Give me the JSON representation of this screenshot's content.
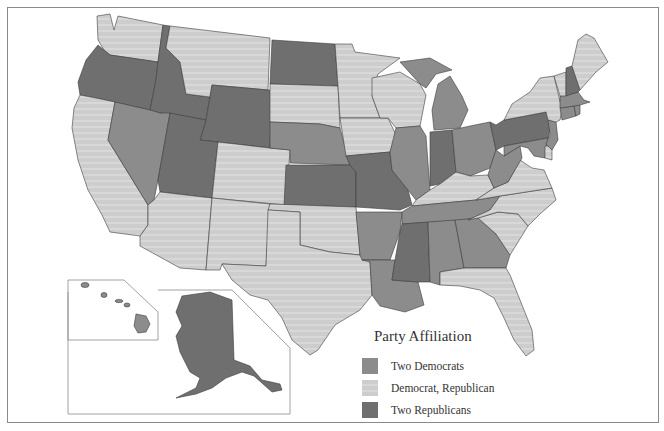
{
  "map": {
    "title": "Party Affiliation",
    "colors": {
      "two_democrats": "#8c8c8c",
      "democrat_republican": "#cdcdcd",
      "two_republicans": "#6f6f6f",
      "border": "#3c3c3c",
      "frame": "#8a8a8a"
    },
    "legend": {
      "title": "Party Affiliation",
      "items": [
        {
          "label": "Two Democrats",
          "key": "two_democrats"
        },
        {
          "label": "Democrat, Republican",
          "key": "democrat_republican"
        },
        {
          "label": "Two Republicans",
          "key": "two_republicans"
        }
      ]
    },
    "states": {
      "WA": "democrat_republican",
      "OR": "two_republicans",
      "CA": "democrat_republican",
      "ID": "two_republicans",
      "NV": "two_democrats",
      "MT": "democrat_republican",
      "WY": "two_republicans",
      "UT": "two_republicans",
      "AZ": "democrat_republican",
      "CO": "democrat_republican",
      "NM": "democrat_republican",
      "ND": "two_republicans",
      "SD": "democrat_republican",
      "NE": "two_democrats",
      "KS": "two_republicans",
      "OK": "democrat_republican",
      "TX": "democrat_republican",
      "MN": "democrat_republican",
      "IA": "democrat_republican",
      "MO": "two_republicans",
      "AR": "two_democrats",
      "LA": "two_democrats",
      "WI": "democrat_republican",
      "IL": "two_democrats",
      "MI": "two_democrats",
      "IN": "two_republicans",
      "OH": "two_democrats",
      "KY": "democrat_republican",
      "TN": "two_democrats",
      "MS": "two_republicans",
      "AL": "two_democrats",
      "GA": "two_democrats",
      "FL": "democrat_republican",
      "SC": "democrat_republican",
      "NC": "democrat_republican",
      "VA": "democrat_republican",
      "WV": "two_democrats",
      "PA": "two_republicans",
      "NY": "democrat_republican",
      "VT": "democrat_republican",
      "NH": "two_republicans",
      "ME": "democrat_republican",
      "MA": "two_democrats",
      "CT": "two_democrats",
      "RI": "two_democrats",
      "NJ": "two_democrats",
      "DE": "democrat_republican",
      "MD": "two_democrats",
      "AK": "two_republicans",
      "HI": "two_democrats"
    }
  }
}
